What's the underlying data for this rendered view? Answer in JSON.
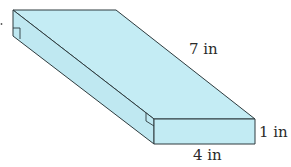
{
  "figure": {
    "type": "rectangular prism",
    "fill_color": "#c4ecf4",
    "edge_color": "#2e3b3e",
    "labels": {
      "length": "7 in",
      "width": "4 in",
      "height": "1 in"
    }
  }
}
